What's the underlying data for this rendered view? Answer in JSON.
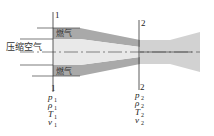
{
  "diagram": {
    "type": "combustor-nozzle-schematic",
    "inlet_label": "压缩空气",
    "fuel_gas_labels": [
      "燃气",
      "燃气"
    ],
    "sections": [
      {
        "id": "1",
        "label": "1",
        "variables": [
          {
            "symbol": "p",
            "subscript": "1"
          },
          {
            "symbol": "ρ",
            "subscript": "1"
          },
          {
            "symbol": "T",
            "subscript": "1"
          },
          {
            "symbol": "v",
            "subscript": "1"
          }
        ]
      },
      {
        "id": "2",
        "label": "2",
        "variables": [
          {
            "symbol": "p",
            "subscript": "2"
          },
          {
            "symbol": "ρ",
            "subscript": "2"
          },
          {
            "symbol": "T",
            "subscript": "2"
          },
          {
            "symbol": "v",
            "subscript": "2"
          }
        ]
      }
    ],
    "colors": {
      "fuel_gas_fill": "#a9a9a9",
      "air_fill": "#e6e6e6",
      "mixed_fill": "#cfcfcf",
      "line": "#444444"
    }
  }
}
